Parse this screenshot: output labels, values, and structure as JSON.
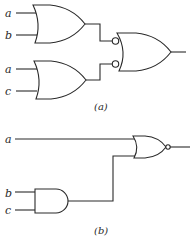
{
  "figure_a": {
    "caption": "(a)",
    "inputs": [
      "a",
      "b",
      "a",
      "c"
    ],
    "gates": [
      {
        "id": "or1",
        "type": "OR",
        "inputs": [
          "a",
          "b"
        ]
      },
      {
        "id": "or2",
        "type": "OR",
        "inputs": [
          "a",
          "c"
        ]
      },
      {
        "id": "or3",
        "type": "OR with inverted inputs",
        "inputs": [
          "or1",
          "or2"
        ]
      }
    ]
  },
  "figure_b": {
    "caption": "(b)",
    "inputs": [
      "a",
      "b",
      "c"
    ],
    "gates": [
      {
        "id": "and1",
        "type": "AND",
        "inputs": [
          "b",
          "c"
        ]
      },
      {
        "id": "nor1",
        "type": "NOR",
        "inputs": [
          "a",
          "and1"
        ]
      }
    ]
  }
}
